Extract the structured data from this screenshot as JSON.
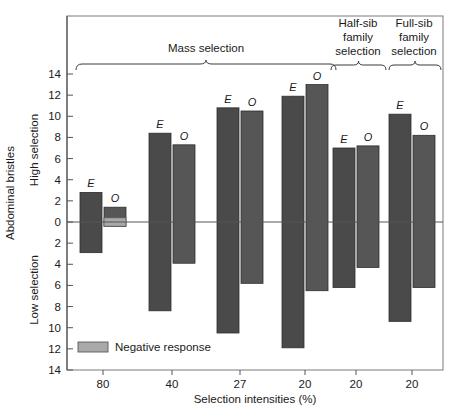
{
  "chart_data": {
    "type": "bar",
    "title": "",
    "xlabel": "Selection intensities (%)",
    "ylabel": "Abdominal bristles",
    "ylabel_upper": "High selection",
    "ylabel_lower": "Low selection",
    "ylim": [
      -14,
      14
    ],
    "ytick_values": [
      14,
      12,
      10,
      8,
      6,
      4,
      2,
      0,
      -2,
      -4,
      -6,
      -8,
      -10,
      -12,
      -14
    ],
    "ytick_labels": [
      "14",
      "12",
      "10",
      "8",
      "6",
      "4",
      "2",
      "0",
      "2",
      "4",
      "6",
      "8",
      "10",
      "12",
      "14"
    ],
    "grid": false,
    "zero_line": true,
    "legend": {
      "position": "bottom-left-inside",
      "entries": [
        {
          "label": "Negative response",
          "color": "#a8a8a8"
        }
      ]
    },
    "series": [
      {
        "name": "E",
        "label": "E",
        "color": "#4a4a4a"
      },
      {
        "name": "O",
        "label": "O",
        "color": "#5a5a5a"
      }
    ],
    "group_brackets": [
      {
        "label": "Mass selection",
        "spans": [
          0,
          3
        ],
        "multiline": [
          "Mass selection"
        ]
      },
      {
        "label": "Half-sib family selection",
        "spans": [
          4,
          4
        ],
        "multiline": [
          "Half-sib",
          "family",
          "selection"
        ]
      },
      {
        "label": "Full-sib family selection",
        "spans": [
          5,
          5
        ],
        "multiline": [
          "Full-sib",
          "family",
          "selection"
        ]
      }
    ],
    "categories": [
      "80",
      "40",
      "27",
      "20",
      "20",
      "20"
    ],
    "groups": [
      {
        "xlabel": "80",
        "bars": [
          {
            "series": "E",
            "high": 2.8,
            "low": -2.9,
            "negative_segment": null
          },
          {
            "series": "O",
            "high": 1.4,
            "low": -0.4,
            "negative_segment": {
              "from": 0.4,
              "to": -0.4
            }
          }
        ]
      },
      {
        "xlabel": "40",
        "bars": [
          {
            "series": "E",
            "high": 8.4,
            "low": -8.4,
            "negative_segment": null
          },
          {
            "series": "O",
            "high": 7.3,
            "low": -3.9,
            "negative_segment": null
          }
        ]
      },
      {
        "xlabel": "27",
        "bars": [
          {
            "series": "E",
            "high": 10.8,
            "low": -10.5,
            "negative_segment": null
          },
          {
            "series": "O",
            "high": 10.5,
            "low": -5.8,
            "negative_segment": null
          }
        ]
      },
      {
        "xlabel": "20",
        "bars": [
          {
            "series": "E",
            "high": 11.9,
            "low": -11.9,
            "negative_segment": null
          },
          {
            "series": "O",
            "high": 13.0,
            "low": -6.5,
            "negative_segment": null
          }
        ]
      },
      {
        "xlabel": "20",
        "bars": [
          {
            "series": "E",
            "high": 7.0,
            "low": -6.2,
            "negative_segment": null
          },
          {
            "series": "O",
            "high": 7.2,
            "low": -4.3,
            "negative_segment": null
          }
        ]
      },
      {
        "xlabel": "20",
        "bars": [
          {
            "series": "E",
            "high": 10.2,
            "low": -9.4,
            "negative_segment": null
          },
          {
            "series": "O",
            "high": 8.2,
            "low": -6.2,
            "negative_segment": null
          }
        ]
      }
    ]
  },
  "axis": {
    "y_title": "Abdominal bristles",
    "y_upper_title": "High selection",
    "y_lower_title": "Low selection",
    "x_title": "Selection intensities (%)"
  },
  "brackets": {
    "mass": "Mass selection",
    "halfsib_line1": "Half-sib",
    "halfsib_line2": "family",
    "halfsib_line3": "selection",
    "fullsib_line1": "Full-sib",
    "fullsib_line2": "family",
    "fullsib_line3": "selection"
  },
  "legend": {
    "negative_response": "Negative response"
  },
  "series_labels": {
    "e": "E",
    "o": "O"
  },
  "ticks": {
    "y": [
      "14",
      "12",
      "10",
      "8",
      "6",
      "4",
      "2",
      "0",
      "2",
      "4",
      "6",
      "8",
      "10",
      "12",
      "14"
    ],
    "x": [
      "80",
      "40",
      "27",
      "20",
      "20",
      "20"
    ]
  },
  "colors": {
    "bar_e": "#4a4a4a",
    "bar_o": "#565656",
    "negative_response": "#a9a9a9",
    "axis": "#555555",
    "text": "#1a1a1a",
    "background": "#ffffff"
  }
}
